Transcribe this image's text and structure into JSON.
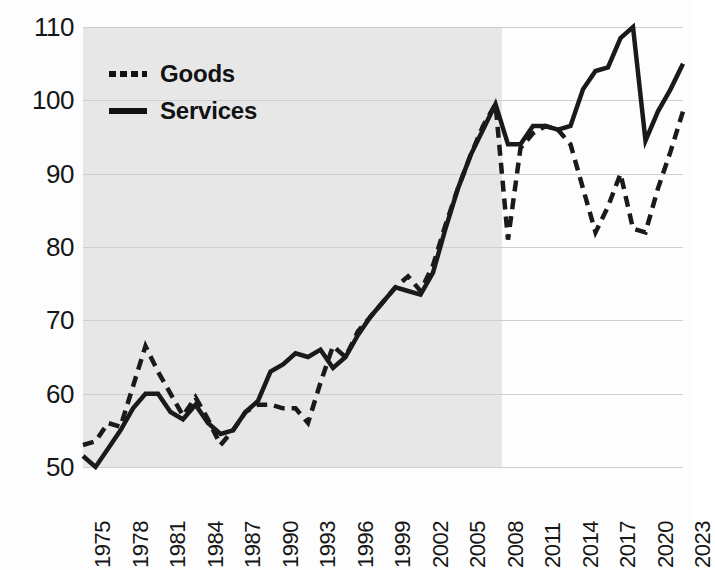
{
  "chart_data": {
    "type": "line",
    "title": "",
    "subtitle": "",
    "xlabel": "",
    "ylabel": "",
    "xlim": [
      1975,
      2023
    ],
    "ylim": [
      50,
      110
    ],
    "grid": true,
    "legend_position": "top-left",
    "y_ticks": [
      110,
      100,
      90,
      80,
      70,
      60,
      50
    ],
    "x_ticks": [
      "1975",
      "1978",
      "1981",
      "1984",
      "1987",
      "1990",
      "1993",
      "1996",
      "1999",
      "2002",
      "2005",
      "2008",
      "2011",
      "2014",
      "2017",
      "2020",
      "2023"
    ],
    "x": [
      1975,
      1976,
      1977,
      1978,
      1979,
      1980,
      1981,
      1982,
      1983,
      1984,
      1985,
      1986,
      1987,
      1988,
      1989,
      1990,
      1991,
      1992,
      1993,
      1994,
      1995,
      1996,
      1997,
      1998,
      1999,
      2000,
      2001,
      2002,
      2003,
      2004,
      2005,
      2006,
      2007,
      2008,
      2009,
      2010,
      2011,
      2012,
      2013,
      2014,
      2015,
      2016,
      2017,
      2018,
      2019,
      2020,
      2021,
      2022,
      2023
    ],
    "shaded_band": {
      "label": "",
      "x_start": 1975,
      "x_end": 2008.5,
      "color": "#e7e7e7"
    },
    "series": [
      {
        "name": "Goods",
        "style": "dashed",
        "color": "#1a1a1a",
        "values": [
          53.0,
          53.5,
          56.0,
          55.5,
          61.0,
          66.5,
          63.0,
          60.0,
          57.0,
          59.5,
          56.5,
          53.0,
          55.0,
          57.5,
          58.5,
          58.5,
          58.0,
          58.0,
          56.0,
          61.5,
          66.5,
          65.0,
          68.5,
          70.5,
          72.5,
          74.5,
          76.0,
          74.0,
          77.5,
          83.0,
          88.0,
          92.5,
          96.5,
          99.5,
          81.0,
          93.5,
          95.5,
          96.5,
          96.0,
          94.0,
          88.0,
          82.0,
          85.5,
          90.0,
          82.5,
          82.0,
          88.0,
          93.0,
          98.5
        ]
      },
      {
        "name": "Services",
        "style": "solid",
        "color": "#1a1a1a",
        "values": [
          51.5,
          50.0,
          52.5,
          55.0,
          58.0,
          60.0,
          60.0,
          57.5,
          56.5,
          58.5,
          56.0,
          54.5,
          55.0,
          57.5,
          59.0,
          63.0,
          64.0,
          65.5,
          65.0,
          66.0,
          63.5,
          65.0,
          68.0,
          70.5,
          72.5,
          74.5,
          74.0,
          73.5,
          76.5,
          82.5,
          88.0,
          92.5,
          96.0,
          99.5,
          94.0,
          94.0,
          96.5,
          96.5,
          96.0,
          96.5,
          101.5,
          104.0,
          104.5,
          108.5,
          110.0,
          94.5,
          98.5,
          101.5,
          105.0
        ]
      }
    ]
  },
  "legend": {
    "items": [
      {
        "label": "Goods",
        "style": "dashed"
      },
      {
        "label": "Services",
        "style": "solid"
      }
    ]
  }
}
